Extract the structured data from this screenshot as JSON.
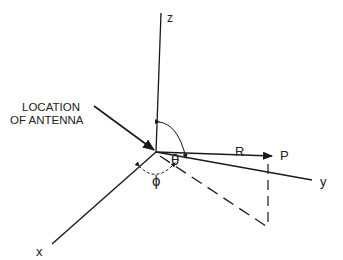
{
  "diagram": {
    "type": "spherical-coordinate-system",
    "axes": {
      "x": "x",
      "y": "y",
      "z": "z"
    },
    "annotation": {
      "line1": "LOCATION",
      "line2": "OF ANTENNA"
    },
    "vector_label": "R",
    "point_label": "P",
    "polar_angle_label": "θ",
    "azimuth_angle_label": "ϕ",
    "colors": {
      "line": "#1a1a1a",
      "background": "#ffffff"
    }
  }
}
